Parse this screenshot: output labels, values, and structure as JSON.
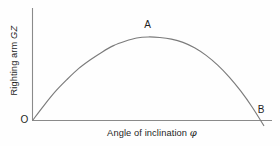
{
  "figure": {
    "title": "",
    "background_color": "#fefefe",
    "line_color": "#7b7b7b",
    "axis_color": "#8a8a8a",
    "text_color": "#1f1f1f"
  },
  "axes": {
    "y_label_prefix": "Righting arm ",
    "y_label_symbol": "GZ",
    "x_label_prefix": "Angle of inclination ",
    "x_label_symbol": "φ",
    "origin_label": "O"
  },
  "annotations": {
    "apex_label": "A",
    "zero_crossing_label": "B"
  },
  "chart_data": {
    "type": "line",
    "title": "",
    "xlabel": "Angle of inclination φ",
    "ylabel": "Righting arm GZ",
    "grid": false,
    "legend": false,
    "xlim": [
      0,
      100
    ],
    "ylim": [
      -0.08,
      1.0
    ],
    "x": [
      0,
      5,
      10,
      15,
      20,
      25,
      30,
      35,
      40,
      45,
      50,
      55,
      60,
      65,
      70,
      75,
      80,
      85,
      90,
      95,
      100
    ],
    "y": [
      0.0,
      0.14,
      0.27,
      0.38,
      0.48,
      0.56,
      0.63,
      0.69,
      0.73,
      0.76,
      0.77,
      0.765,
      0.75,
      0.72,
      0.67,
      0.6,
      0.51,
      0.4,
      0.27,
      0.12,
      -0.05
    ],
    "annotations": [
      {
        "label": "O",
        "x": 0,
        "y": 0,
        "note": "origin"
      },
      {
        "label": "A",
        "x": 50,
        "y": 0.77,
        "note": "maximum righting arm"
      },
      {
        "label": "B",
        "x": 96,
        "y": 0,
        "note": "angle of vanishing stability"
      }
    ]
  }
}
